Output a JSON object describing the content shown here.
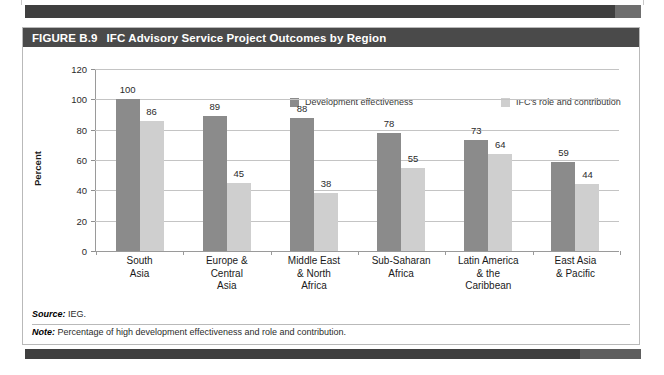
{
  "figure": {
    "number": "FIGURE B.9",
    "title": "IFC Advisory Service Project Outcomes by Region"
  },
  "notes": {
    "source_label": "Source:",
    "source_text": " IEG.",
    "note_label": "Note:",
    "note_text": " Percentage of high development effectiveness and role and contribution."
  },
  "colors": {
    "series_dark": "#8b8b8b",
    "series_light": "#cfcfcf",
    "title_bar": "#4a4a4a",
    "gridline": "#c4c4c4",
    "axis": "#9a9a9a"
  },
  "chart_data": {
    "type": "bar",
    "title": "IFC Advisory Service Project Outcomes by Region",
    "xlabel": "",
    "ylabel": "Percent",
    "ylim": [
      0,
      120
    ],
    "yticks": [
      0,
      20,
      40,
      60,
      80,
      100,
      120
    ],
    "ytick_labels": [
      "0",
      "20",
      "40",
      "60",
      "80",
      "100",
      "120"
    ],
    "grid": true,
    "legend_position": "top-right",
    "categories": [
      "South Asia",
      "Europe & Central Asia",
      "Middle East & North Africa",
      "Sub-Saharan Africa",
      "Latin America & the Caribbean",
      "East Asia & Pacific"
    ],
    "category_lines": [
      [
        "South",
        "Asia"
      ],
      [
        "Europe &",
        "Central",
        "Asia"
      ],
      [
        "Middle East",
        "& North",
        "Africa"
      ],
      [
        "Sub-Saharan",
        "Africa"
      ],
      [
        "Latin America",
        "& the",
        "Caribbean"
      ],
      [
        "East Asia",
        "& Pacific"
      ]
    ],
    "series": [
      {
        "name": "Development effectiveness",
        "color": "#8b8b8b",
        "values": [
          100,
          89,
          88,
          78,
          73,
          59
        ]
      },
      {
        "name": "IFC's role and contribution",
        "color": "#cfcfcf",
        "values": [
          86,
          45,
          38,
          55,
          64,
          44
        ]
      }
    ]
  }
}
